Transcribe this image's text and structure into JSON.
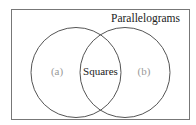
{
  "diagram": {
    "type": "venn",
    "universe_label": "Parallelograms",
    "sets": [
      {
        "id": "a",
        "label": "(a)"
      },
      {
        "id": "b",
        "label": "(b)"
      }
    ],
    "intersection_label": "Squares",
    "colors": {
      "stroke": "#555555",
      "text": "#222222",
      "placeholder_text": "#999999",
      "background": "#ffffff"
    }
  }
}
